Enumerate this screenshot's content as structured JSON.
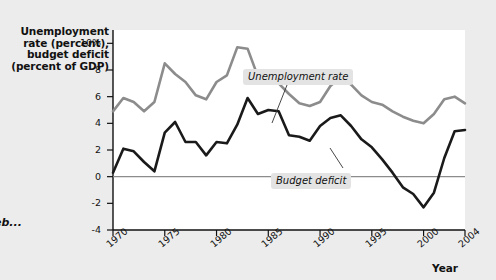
{
  "figure": {
    "y_axis_title": "Unemployment\nrate (percent),\nbudget deficit\n(percent of GDP)",
    "x_axis_title": "Year",
    "corner_note": "eb...",
    "label_unemployment": "Unemployment rate",
    "label_deficit": "Budget deficit",
    "color_unemployment": "#8c8c8c",
    "color_deficit": "#1a1a1a",
    "color_plot_background": "#ffffff",
    "color_page_background": "#ececec",
    "color_label_chip": "#e3e3e3"
  },
  "chart_data": {
    "type": "line",
    "title": "",
    "xlabel": "Year",
    "ylabel": "Unemployment rate (percent), budget deficit (percent of GDP)",
    "xlim": [
      1970,
      2004
    ],
    "ylim": [
      -4,
      11
    ],
    "grid": false,
    "legend": "inline-annotations",
    "xticks": [
      1970,
      1975,
      1980,
      1985,
      1990,
      1995,
      2000,
      2004
    ],
    "xtick_labels": [
      "1970",
      "1975",
      "1980",
      "1985",
      "1990",
      "1995",
      "2000",
      "2004"
    ],
    "yticks": [
      -4,
      -2,
      0,
      2,
      4,
      6,
      8,
      10
    ],
    "ytick_labels": [
      "-4",
      "-2",
      "0",
      "2",
      "4",
      "6",
      "8",
      "10%"
    ],
    "zero_line": 0,
    "x": [
      1970,
      1971,
      1972,
      1973,
      1974,
      1975,
      1976,
      1977,
      1978,
      1979,
      1980,
      1981,
      1982,
      1983,
      1984,
      1985,
      1986,
      1987,
      1988,
      1989,
      1990,
      1991,
      1992,
      1993,
      1994,
      1995,
      1996,
      1997,
      1998,
      1999,
      2000,
      2001,
      2002,
      2003,
      2004
    ],
    "series": [
      {
        "name": "Unemployment rate",
        "color": "#8c8c8c",
        "units": "percent",
        "values": [
          4.9,
          5.9,
          5.6,
          4.9,
          5.6,
          8.5,
          7.7,
          7.1,
          6.1,
          5.8,
          7.1,
          7.6,
          9.7,
          9.6,
          7.5,
          7.2,
          7.0,
          6.2,
          5.5,
          5.3,
          5.6,
          6.8,
          7.5,
          6.9,
          6.1,
          5.6,
          5.4,
          4.9,
          4.5,
          4.2,
          4.0,
          4.7,
          5.8,
          6.0,
          5.5
        ]
      },
      {
        "name": "Budget deficit",
        "color": "#1a1a1a",
        "units": "percent of GDP",
        "values": [
          0.3,
          2.1,
          1.9,
          1.1,
          0.4,
          3.3,
          4.1,
          2.6,
          2.6,
          1.6,
          2.6,
          2.5,
          3.9,
          5.9,
          4.7,
          5.0,
          4.9,
          3.1,
          3.0,
          2.7,
          3.8,
          4.4,
          4.6,
          3.8,
          2.8,
          2.2,
          1.3,
          0.3,
          -0.8,
          -1.3,
          -2.3,
          -1.2,
          1.4,
          3.4,
          3.5
        ]
      }
    ]
  }
}
